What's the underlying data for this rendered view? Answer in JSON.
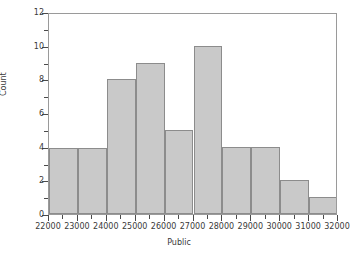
{
  "chart_data": {
    "type": "bar",
    "title": "",
    "xlabel": "Public",
    "ylabel": "Count",
    "xlim": [
      22000,
      32000
    ],
    "ylim": [
      0,
      12
    ],
    "bin_width": 1000,
    "grid": false,
    "legend": null,
    "categories": [
      "22000-23000",
      "23000-24000",
      "24000-25000",
      "25000-26000",
      "26000-27000",
      "27000-28000",
      "28000-29000",
      "29000-30000",
      "30000-31000",
      "31000-32000"
    ],
    "bin_edges": [
      22000,
      23000,
      24000,
      25000,
      26000,
      27000,
      28000,
      29000,
      30000,
      31000,
      32000
    ],
    "values": [
      3.9,
      3.9,
      8,
      9,
      5,
      10,
      4,
      4,
      2,
      1
    ],
    "xticks": [
      22000,
      23000,
      24000,
      25000,
      26000,
      27000,
      28000,
      29000,
      30000,
      31000,
      32000
    ],
    "xtick_labels": [
      "22000",
      "23000",
      "24000",
      "25000",
      "26000",
      "27000",
      "28000",
      "29000",
      "30000",
      "31000",
      "32000"
    ],
    "yticks": [
      0,
      2,
      4,
      6,
      8,
      10,
      12
    ],
    "ytick_labels": [
      "0",
      "2",
      "4",
      "6",
      "8",
      "10",
      "12"
    ],
    "yticks_minor": [
      1,
      3,
      5,
      7,
      9,
      11
    ],
    "colors": {
      "bar_fill": "#c9c9c9",
      "bar_edge": "#8c8c8c",
      "frame": "#9a9a9a",
      "text": "#3a3a3a",
      "background": "#ffffff"
    }
  }
}
